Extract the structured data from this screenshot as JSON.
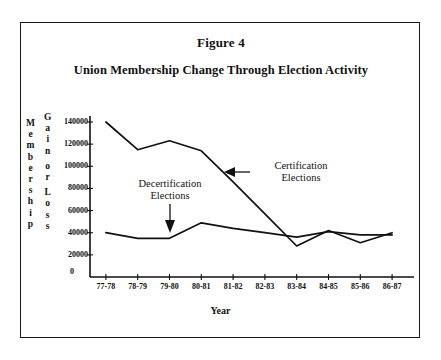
{
  "figure": {
    "label": "Figure 4",
    "title": "Union Membership Change Through Election Activity"
  },
  "axes": {
    "y_axis_label_left": "Membership",
    "y_axis_label_right": "Gain or Loss",
    "x_axis_label": "Year",
    "zero_label": "0",
    "y_ticks": [
      "140000",
      "120000",
      "100000",
      "80000",
      "60000",
      "40000",
      "20000"
    ]
  },
  "annotations": [
    {
      "name": "decertification",
      "line1": "Decertification",
      "line2": "Elections"
    },
    {
      "name": "certification",
      "line1": "Certification",
      "line2": "Elections"
    }
  ],
  "chart_data": {
    "type": "line",
    "title": "Union Membership Change Through Election Activity",
    "xlabel": "Year",
    "ylabel": "Membership Gain or Loss",
    "categories": [
      "77-78",
      "78-79",
      "79-80",
      "80-81",
      "81-82",
      "82-83",
      "83-84",
      "84-85",
      "85-86",
      "86-87"
    ],
    "ylim": [
      0,
      140000
    ],
    "yticks": [
      20000,
      40000,
      60000,
      80000,
      100000,
      120000,
      140000
    ],
    "grid": false,
    "legend": "annotated-inline",
    "series": [
      {
        "name": "Certification Elections",
        "values": [
          140000,
          115000,
          123000,
          114000,
          86000,
          57000,
          28000,
          42000,
          31000,
          40000
        ]
      },
      {
        "name": "Decertification Elections",
        "values": [
          40000,
          35000,
          35000,
          49000,
          44000,
          40000,
          36000,
          41000,
          38000,
          38000
        ]
      }
    ]
  }
}
